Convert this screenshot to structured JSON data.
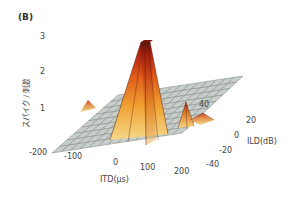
{
  "panel_label": "(B)",
  "chart_data": {
    "type": "surface3d",
    "title": "",
    "xlabel": "ITD(μs)",
    "ylabel": "ILD(dB)",
    "zlabel": "スパイク / 刺激",
    "x_ticks": [
      "-200",
      "-100",
      "0",
      "100",
      "200"
    ],
    "y_ticks": [
      "40",
      "20",
      "0",
      "-20",
      "-40"
    ],
    "z_ticks": [
      "1",
      "2",
      "3"
    ],
    "xlim": [
      -200,
      200
    ],
    "ylim": [
      -40,
      40
    ],
    "zlim": [
      0,
      3
    ],
    "peaks": [
      {
        "itd": 50,
        "ild": 10,
        "z": 2.9,
        "label": "main peak"
      },
      {
        "itd": 180,
        "ild": 20,
        "z": 1.3
      },
      {
        "itd": 200,
        "ild": 0,
        "z": 0.6
      },
      {
        "itd": -140,
        "ild": 30,
        "z": 0.5
      }
    ],
    "colormap": [
      "#f5d98a",
      "#f0a030",
      "#e05a1a",
      "#b01e10",
      "#6e1a10"
    ],
    "surface_color": "#c8cfcb",
    "grid": true
  }
}
